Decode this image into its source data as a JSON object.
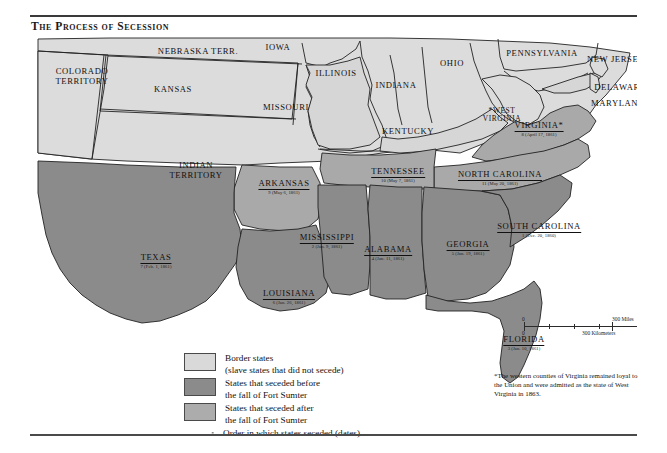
{
  "title": "The Process of Secession",
  "colors": {
    "border_states": "#d6d6d6",
    "seceded_before": "#8b8b8b",
    "seceded_after": "#a9a9a9",
    "union_states": "#dcdcdc",
    "outline": "#222222",
    "background": "#ffffff"
  },
  "states": {
    "union_and_territories": [
      {
        "name": "COLORADO TERRITORY",
        "x": 52,
        "y": 40
      },
      {
        "name": "NEBRASKA TERR.",
        "x": 168,
        "y": 18
      },
      {
        "name": "IOWA",
        "x": 248,
        "y": 14
      },
      {
        "name": "KANSAS",
        "x": 143,
        "y": 55
      },
      {
        "name": "MISSOURI",
        "x": 254,
        "y": 73
      },
      {
        "name": "ILLINOIS",
        "x": 306,
        "y": 38
      },
      {
        "name": "INDIANA",
        "x": 364,
        "y": 48
      },
      {
        "name": "OHIO",
        "x": 420,
        "y": 27
      },
      {
        "name": "PENNSYLVANIA",
        "x": 510,
        "y": 18
      },
      {
        "name": "NEW JERSEY",
        "x": 593,
        "y": 23
      },
      {
        "name": "DELAWARE",
        "x": 590,
        "y": 52
      },
      {
        "name": "MARYLAND",
        "x": 588,
        "y": 67
      },
      {
        "name": "KENTUCKY",
        "x": 375,
        "y": 95
      },
      {
        "name": "INDIAN TERRITORY",
        "x": 165,
        "y": 134
      },
      {
        "name": "*WEST VIRGINIA",
        "x": 470,
        "y": 78
      }
    ],
    "seceded": [
      {
        "name": "SOUTH CAROLINA",
        "order": 1,
        "date": "Dec. 20, 1860",
        "label": "1 (Dec. 20, 1860)",
        "group": "before",
        "x": 509,
        "y": 185
      },
      {
        "name": "MISSISSIPPI",
        "order": 2,
        "date": "Jan. 9, 1861",
        "label": "2 (Jan. 9, 1861)",
        "group": "before",
        "x": 295,
        "y": 196
      },
      {
        "name": "FLORIDA",
        "order": 3,
        "date": "Jan. 10, 1861",
        "label": "3 (Jan. 10, 1861)",
        "group": "before",
        "x": 494,
        "y": 298
      },
      {
        "name": "ALABAMA",
        "order": 4,
        "date": "Jan. 11, 1861",
        "label": "4 (Jan. 11, 1861)",
        "group": "before",
        "x": 357,
        "y": 207
      },
      {
        "name": "GEORGIA",
        "order": 5,
        "date": "Jan. 19, 1861",
        "label": "5 (Jan. 19, 1861)",
        "group": "before",
        "x": 438,
        "y": 203
      },
      {
        "name": "LOUISIANA",
        "order": 6,
        "date": "Jan. 26, 1861",
        "label": "6 (Jan. 26, 1861)",
        "group": "before",
        "x": 258,
        "y": 252
      },
      {
        "name": "TEXAS",
        "order": 7,
        "date": "Feb. 1, 1861",
        "label": "7 (Feb. 1, 1861)",
        "group": "before",
        "x": 125,
        "y": 216
      },
      {
        "name": "VIRGINIA*",
        "order": 8,
        "date": "April 17, 1861",
        "label": "8 (April 17, 1861)",
        "group": "after",
        "x": 509,
        "y": 84
      },
      {
        "name": "ARKANSAS",
        "order": 9,
        "date": "May 6, 1861",
        "label": "9 (May 6, 1861)",
        "group": "after",
        "x": 255,
        "y": 140
      },
      {
        "name": "TENNESSEE",
        "order": 10,
        "date": "May 7, 1861",
        "label": "10 (May 7, 1861)",
        "group": "after",
        "x": 368,
        "y": 130
      },
      {
        "name": "NORTH CAROLINA",
        "order": 11,
        "date": "May 20, 1861",
        "label": "11 (May 20, 1861)",
        "group": "after",
        "x": 470,
        "y": 133
      }
    ]
  },
  "legend": {
    "items": [
      {
        "swatch": "border_states",
        "line1": "Border states",
        "line2": "(slave states that did not secede)"
      },
      {
        "swatch": "seceded_before",
        "line1": "States that seceded before",
        "line2": "the fall of Fort Sumter"
      },
      {
        "swatch": "seceded_after",
        "line1": "States that seceded after",
        "line2": "the fall of Fort Sumter"
      },
      {
        "swatch": "none",
        "number": "5",
        "line1": "Order in which states seceded (dates)",
        "line2": ""
      }
    ]
  },
  "scale": {
    "miles_zero": "0",
    "miles_max": "300 Miles",
    "km_zero": "0",
    "km_max": "300 Kilometers"
  },
  "footnote": "*The western counties of Virginia remained loyal to the Union and were admitted as the state of West Virginia in 1863."
}
